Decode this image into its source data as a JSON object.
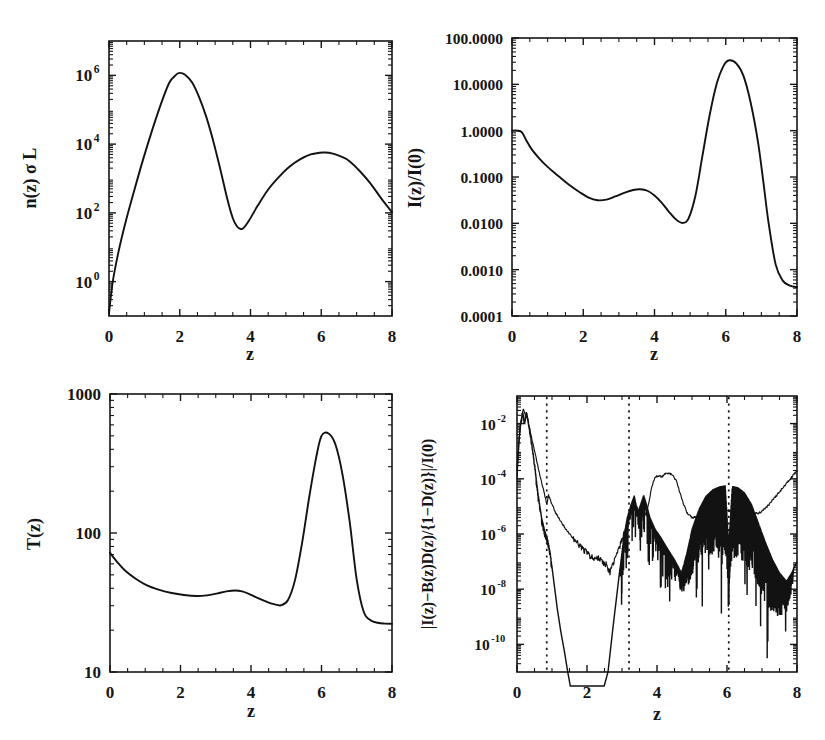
{
  "figure": {
    "background": "#ffffff",
    "ink": "#161616",
    "panel_count": 4
  },
  "chart_data": [
    {
      "id": "panel-density",
      "position": "top-left",
      "type": "line",
      "title": "",
      "xlabel": "z",
      "ylabel": "n(z) σ L",
      "xlim": [
        0,
        8
      ],
      "ylim": [
        0.1,
        10000000
      ],
      "yscale": "log",
      "xscale": "linear",
      "grid": false,
      "legend": "none",
      "xticks": [
        0,
        2,
        4,
        6,
        8
      ],
      "xticklabels": [
        "0",
        "2",
        "4",
        "6",
        "8"
      ],
      "yticks": [
        1,
        100,
        10000,
        1000000
      ],
      "yticklabels": [
        "10^0",
        "10^2",
        "10^4",
        "10^6"
      ],
      "ytick_mantissa": [
        "10",
        "10",
        "10",
        "10"
      ],
      "ytick_exponent": [
        "0",
        "2",
        "4",
        "6"
      ],
      "series": [
        {
          "name": "n(z) sigma L",
          "x": [
            0.0,
            0.1,
            0.25,
            0.45,
            0.7,
            0.95,
            1.2,
            1.45,
            1.7,
            1.9,
            2.0,
            2.15,
            2.35,
            2.55,
            2.75,
            2.95,
            3.15,
            3.35,
            3.5,
            3.62,
            3.72,
            3.8,
            3.95,
            4.2,
            4.5,
            4.8,
            5.1,
            5.4,
            5.7,
            5.95,
            6.1,
            6.3,
            6.55,
            6.8,
            7.1,
            7.4,
            7.7,
            8.0
          ],
          "y": [
            0.12,
            0.9,
            6.0,
            45.0,
            400.0,
            3200.0,
            22000.0,
            130000.0,
            600000.0,
            1050000.0,
            1180000.0,
            1050000.0,
            620000.0,
            230000.0,
            62000.0,
            12000.0,
            1800.0,
            240.0,
            70.0,
            40.0,
            34.0,
            36.0,
            58.0,
            160.0,
            480.0,
            1100.0,
            2200.0,
            3600.0,
            5000.0,
            5600.0,
            5700.0,
            5400.0,
            4400.0,
            3200.0,
            1600.0,
            700.0,
            260.0,
            105.0
          ]
        }
      ],
      "annotations": []
    },
    {
      "id": "panel-intensity",
      "position": "top-right",
      "type": "line",
      "title": "",
      "xlabel": "z",
      "ylabel": "I(z)/I(0)",
      "xlim": [
        0,
        8
      ],
      "ylim": [
        0.0001,
        100.0
      ],
      "yscale": "log",
      "xscale": "linear",
      "grid": false,
      "legend": "none",
      "xticks": [
        0,
        2,
        4,
        6,
        8
      ],
      "xticklabels": [
        "0",
        "2",
        "4",
        "6",
        "8"
      ],
      "yticks": [
        0.0001,
        0.001,
        0.01,
        0.1,
        1.0,
        10.0,
        100.0
      ],
      "yticklabels": [
        "0.0001",
        "0.0010",
        "0.0100",
        "0.1000",
        "1.0000",
        "10.0000",
        "100.0000"
      ],
      "series": [
        {
          "name": "I(z)/I(0)",
          "x": [
            0.0,
            0.15,
            0.28,
            0.4,
            0.55,
            0.75,
            1.0,
            1.3,
            1.6,
            1.9,
            2.15,
            2.4,
            2.65,
            2.9,
            3.15,
            3.4,
            3.6,
            3.8,
            4.0,
            4.2,
            4.4,
            4.6,
            4.78,
            4.95,
            5.15,
            5.35,
            5.55,
            5.75,
            5.95,
            6.1,
            6.3,
            6.5,
            6.7,
            6.9,
            7.05,
            7.2,
            7.4,
            7.6,
            7.8,
            8.0
          ],
          "y": [
            1.0,
            1.0,
            0.92,
            0.62,
            0.4,
            0.26,
            0.165,
            0.105,
            0.068,
            0.047,
            0.036,
            0.0315,
            0.0325,
            0.038,
            0.0455,
            0.0525,
            0.0545,
            0.0505,
            0.04,
            0.028,
            0.018,
            0.0122,
            0.0102,
            0.0125,
            0.04,
            0.3,
            2.2,
            10.5,
            26.0,
            33.0,
            28.0,
            15.0,
            4.0,
            0.6,
            0.085,
            0.0105,
            0.0013,
            0.00058,
            0.00045,
            0.00042
          ]
        }
      ],
      "annotations": []
    },
    {
      "id": "panel-temperature",
      "position": "bottom-left",
      "type": "line",
      "title": "",
      "xlabel": "z",
      "ylabel": "T(z)",
      "xlim": [
        0,
        8
      ],
      "ylim": [
        10,
        1000
      ],
      "yscale": "log",
      "xscale": "linear",
      "grid": false,
      "legend": "none",
      "xticks": [
        0,
        2,
        4,
        6,
        8
      ],
      "xticklabels": [
        "0",
        "2",
        "4",
        "6",
        "8"
      ],
      "yticks": [
        10,
        100,
        1000
      ],
      "yticklabels": [
        "10",
        "100",
        "1000"
      ],
      "series": [
        {
          "name": "T(z)",
          "x": [
            0.0,
            0.2,
            0.45,
            0.75,
            1.05,
            1.4,
            1.75,
            2.1,
            2.45,
            2.75,
            3.05,
            3.3,
            3.55,
            3.75,
            3.95,
            4.2,
            4.45,
            4.65,
            4.85,
            5.05,
            5.25,
            5.45,
            5.65,
            5.85,
            6.0,
            6.2,
            6.4,
            6.6,
            6.8,
            7.0,
            7.2,
            7.4,
            7.6,
            7.8,
            8.0
          ],
          "y": [
            72.0,
            62.0,
            53.0,
            46.5,
            42.0,
            39.0,
            37.0,
            35.8,
            35.2,
            35.6,
            36.8,
            38.0,
            38.6,
            38.0,
            36.4,
            34.0,
            32.0,
            30.8,
            30.2,
            33.0,
            46.0,
            85.0,
            180.0,
            350.0,
            500.0,
            520.0,
            430.0,
            260.0,
            120.0,
            46.0,
            27.0,
            23.5,
            22.6,
            22.3,
            22.2
          ]
        }
      ],
      "annotations": []
    },
    {
      "id": "panel-residual",
      "position": "bottom-right",
      "type": "line",
      "title": "",
      "xlabel": "z",
      "ylabel": "|I(z)−B(z)D(z)/{1−D(z)}|/I(0)",
      "xlim": [
        0,
        8
      ],
      "ylim": [
        1e-11,
        0.1
      ],
      "yscale": "log",
      "xscale": "linear",
      "grid": false,
      "legend": "none",
      "xticks": [
        0,
        2,
        4,
        6,
        8
      ],
      "xticklabels": [
        "0",
        "2",
        "4",
        "6",
        "8"
      ],
      "yticks": [
        1e-10,
        1e-08,
        1e-06,
        0.0001,
        0.01
      ],
      "yticklabels": [
        "10^-10",
        "10^-8",
        "10^-6",
        "10^-4",
        "10^-2"
      ],
      "ytick_mantissa": [
        "10",
        "10",
        "10",
        "10",
        "10"
      ],
      "ytick_exponent": [
        "-10",
        "-8",
        "-6",
        "-4",
        "-2"
      ],
      "vertical_marker_lines": [
        0.85,
        3.2,
        6.05
      ],
      "vertical_marker_style": "dotted",
      "series": [
        {
          "name": "thick residual",
          "style": "thick",
          "x": [
            0.0,
            0.08,
            0.16,
            0.22,
            0.27,
            0.32,
            0.38,
            0.45,
            0.52,
            0.6,
            0.7,
            0.8,
            0.88,
            0.95,
            1.05,
            1.15,
            1.25,
            1.35,
            1.45,
            1.55,
            2.45,
            2.6,
            2.75,
            2.9,
            3.05,
            3.15,
            3.25,
            3.35,
            3.45,
            3.55,
            3.62,
            3.7,
            3.8,
            3.95,
            4.1,
            4.3,
            4.5,
            4.7,
            4.85,
            5.0,
            5.2,
            5.4,
            5.6,
            5.8,
            5.95,
            6.05,
            6.15,
            6.3,
            6.5,
            6.7,
            6.9,
            7.1,
            7.3,
            7.5,
            7.7,
            7.85,
            8.0
          ],
          "y": [
            0.0002,
            0.006,
            0.025,
            0.01,
            0.03,
            0.012,
            0.004,
            0.001,
            0.0002,
            3e-05,
            4e-06,
            1.2e-06,
            6e-07,
            2e-07,
            2e-08,
            2e-09,
            3e-10,
            6e-11,
            1e-11,
            2e-12,
            2e-12,
            1e-11,
            5e-10,
            2e-08,
            8e-07,
            4e-06,
            1.1e-05,
            2.5e-05,
            6e-06,
            1.4e-05,
            2.6e-05,
            1.2e-05,
            4e-06,
            1.5e-06,
            8e-07,
            3e-07,
            1.2e-07,
            4e-08,
            2e-07,
            1.5e-06,
            8e-06,
            2.4e-05,
            4.2e-05,
            5.4e-05,
            5.8e-05,
            4e-07,
            5.5e-05,
            5e-05,
            3.2e-05,
            1.2e-05,
            2.5e-06,
            5e-07,
            1.2e-07,
            4e-08,
            2e-08,
            4e-08,
            1e-07
          ],
          "noise_region": [
            4.6,
            7.9
          ],
          "noise_decades": 2.6
        },
        {
          "name": "thin residual",
          "style": "thin",
          "x": [
            0.0,
            0.06,
            0.12,
            0.18,
            0.24,
            0.3,
            0.36,
            0.44,
            0.54,
            0.66,
            0.78,
            0.85,
            0.9,
            0.98,
            1.1,
            1.25,
            1.45,
            1.65,
            1.85,
            2.05,
            2.2,
            2.35,
            2.45,
            2.55,
            2.65,
            2.8,
            2.95,
            3.1,
            3.2,
            3.3,
            3.42,
            3.52,
            3.62,
            3.72,
            3.85,
            3.95,
            4.05,
            4.15,
            4.25,
            4.4,
            4.55,
            4.7,
            4.85,
            5.0,
            5.2,
            5.45,
            5.7,
            5.95,
            6.05,
            6.2,
            6.45,
            6.7,
            6.95,
            7.15,
            7.35,
            7.55,
            7.75,
            8.0
          ],
          "y": [
            0.0001,
            0.003,
            0.014,
            0.035,
            0.02,
            0.015,
            0.007,
            0.0022,
            0.0006,
            0.00012,
            3e-05,
            1.2e-05,
            2.5e-05,
            1.4e-05,
            6e-06,
            2.8e-06,
            1.2e-06,
            6e-07,
            3.2e-07,
            1.8e-07,
            1.2e-07,
            1.4e-07,
            9e-08,
            8e-08,
            4e-08,
            1.2e-07,
            4e-07,
            1.6e-06,
            3.5e-06,
            7e-06,
            1e-05,
            6e-06,
            4e-06,
            7e-06,
            5e-05,
            0.00012,
            0.00013,
            0.00012,
            0.00016,
            0.00015,
            9e-05,
            2e-05,
            6e-06,
            4e-06,
            4e-06,
            5e-06,
            6e-06,
            6.5e-06,
            7e-06,
            6.5e-06,
            5e-06,
            5e-06,
            6e-06,
            1e-05,
            2e-05,
            4e-05,
            8e-05,
            0.0002
          ]
        }
      ],
      "annotations": []
    }
  ]
}
